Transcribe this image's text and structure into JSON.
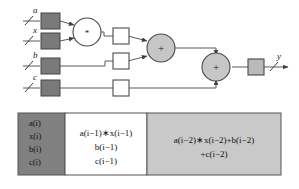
{
  "figure": {
    "signals": {
      "input_a": "a",
      "input_x": "x",
      "input_b": "b",
      "input_c": "c",
      "output_y": "y"
    },
    "operators": {
      "multiply": "*",
      "add_first": "+",
      "add_second": "+"
    },
    "colors": {
      "input_register_fill": "#7a7a7a",
      "pipeline_register_fill": "#ffffff",
      "output_register_fill": "#b9b9b9",
      "adder_fill": "#c6c6c6",
      "multiplier_fill": "#ffffff",
      "stage_dark_fill": "#808080",
      "stage_mid_fill": "#ffffff",
      "stage_light_fill": "#c9c9c9",
      "line_stroke": "#4d4d4d",
      "border_stroke": "#555555",
      "text": "#111111"
    }
  },
  "table": {
    "columns": [
      {
        "id": "stage-inputs",
        "fill_name": "stage_dark_fill",
        "lines": [
          "a(i)",
          "x(i)",
          "b(i)",
          "c(i)"
        ],
        "align": "left"
      },
      {
        "id": "stage-one",
        "fill_name": "stage_mid_fill",
        "lines": [
          "a(i−1)∗x(i−1)",
          "b(i−1)",
          "c(i−1)"
        ],
        "align": "center"
      },
      {
        "id": "stage-two",
        "fill_name": "stage_light_fill",
        "lines": [
          "a(i−2)∗x(i−2)+b(i−2)",
          "+c(i−2)"
        ],
        "align": "center"
      }
    ]
  },
  "cells": {
    "c0l0": "a(i)",
    "c0l1": "x(i)",
    "c0l2": "b(i)",
    "c0l3": "c(i)",
    "c1l0": "a(i−1)∗x(i−1)",
    "c1l1": "b(i−1)",
    "c1l2": "c(i−1)",
    "c2l0": "a(i−2)∗x(i−2)+b(i−2)",
    "c2l1": "+c(i−2)"
  }
}
